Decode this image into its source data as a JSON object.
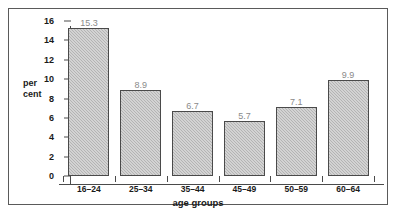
{
  "chart_data": {
    "type": "bar",
    "title": "",
    "subtitle": "",
    "xlabel": "age groups",
    "ylabel": "per cent",
    "ylabel_line1": "per",
    "ylabel_line2": "cent",
    "categories": [
      "16–24",
      "25–34",
      "35–44",
      "45–49",
      "50–59",
      "60–64"
    ],
    "values": [
      15.3,
      8.9,
      6.7,
      5.7,
      7.1,
      9.9
    ],
    "value_labels": [
      "15.3",
      "8.9",
      "6.7",
      "5.7",
      "7.1",
      "9.9"
    ],
    "ylim": [
      0,
      16
    ],
    "yticks": [
      0,
      2,
      4,
      6,
      8,
      10,
      12,
      14,
      16
    ],
    "ytick_labels": [
      "0",
      "2",
      "4",
      "6",
      "8",
      "10",
      "12",
      "14",
      "16"
    ],
    "grid": false,
    "legend": null,
    "bar_fill_color": "#b4b4b4",
    "bar_edge_color": "#4a4a4a",
    "value_label_color": "#8a8a8a",
    "axis_color": "#4a4a4a",
    "frame_color": "#5a5a5a",
    "background_color": "#ffffff"
  }
}
